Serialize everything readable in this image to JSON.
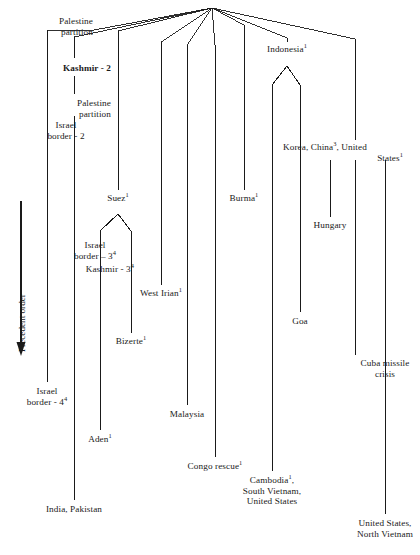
{
  "figure": {
    "kind": "tree-diagram",
    "axis": {
      "label": "Precedent order",
      "direction": "downward-arrow"
    },
    "ink": "#1a1a1a",
    "background": "#ffffff"
  },
  "nodes": [
    {
      "id": "palestine-partition-1",
      "text": "Palestine",
      "text2": "partition",
      "sup": "",
      "align": "r",
      "x": 93,
      "y": 22
    },
    {
      "id": "kashmir-2",
      "text": "Kashmir - 2",
      "sup": "",
      "align": "r",
      "x": 111,
      "y": 68
    },
    {
      "id": "palestine-partition-2",
      "text": "Palestine",
      "text2": "partition",
      "sup": "",
      "align": "r",
      "x": 111,
      "y": 104
    },
    {
      "id": "israel-border-2",
      "text": "Israel",
      "text2": "border - 2",
      "sup": "",
      "align": "r",
      "x": 66,
      "y": 126
    },
    {
      "id": "suez-1",
      "text": "Suez",
      "sup": "1",
      "align": "c",
      "x": 118,
      "y": 198
    },
    {
      "id": "burma-1",
      "text": "Burma",
      "sup": "1",
      "align": "c",
      "x": 244,
      "y": 198
    },
    {
      "id": "korea-china-us",
      "text": "Korea, China",
      "sup": "3",
      "text_tail": ", United",
      "text2": "States",
      "sup2": "1",
      "align": "c",
      "x": 355,
      "y": 148
    },
    {
      "id": "indonesia-1",
      "text": "Indonesia",
      "sup": "1",
      "align": "c",
      "x": 287,
      "y": 50
    },
    {
      "id": "israel-border-3",
      "text": "Israel",
      "text2": "border – 3",
      "sup2": "4",
      "align": "r",
      "x": 72,
      "y": 246
    },
    {
      "id": "kashmir-3",
      "text": "Kashmir - 3",
      "sup": "4",
      "align": "r",
      "x": 99,
      "y": 270
    },
    {
      "id": "hungary",
      "text": "Hungary",
      "sup": "",
      "align": "c",
      "x": 330,
      "y": 225
    },
    {
      "id": "west-irian-1",
      "text": "West Irian",
      "sup": "1",
      "align": "c",
      "x": 161,
      "y": 293
    },
    {
      "id": "bizerte-1",
      "text": "Bizerte",
      "sup": "1",
      "align": "c",
      "x": 131,
      "y": 341
    },
    {
      "id": "goa",
      "text": "Goa",
      "sup": "",
      "align": "c",
      "x": 300,
      "y": 320
    },
    {
      "id": "cuba-missile-crisis",
      "text": "Cuba missile",
      "text2": "crisis",
      "sup": "",
      "align": "c",
      "x": 385,
      "y": 363
    },
    {
      "id": "israel-border-4",
      "text": "Israel",
      "text2": "border - 4",
      "sup2": "4",
      "align": "c",
      "x": 47,
      "y": 390
    },
    {
      "id": "malaysia",
      "text": "Malaysia",
      "sup": "",
      "align": "c",
      "x": 187,
      "y": 413
    },
    {
      "id": "aden-1",
      "text": "Aden",
      "sup": "1",
      "align": "c",
      "x": 100,
      "y": 438
    },
    {
      "id": "congo-rescue-1",
      "text": "Congo rescue",
      "sup": "1",
      "align": "c",
      "x": 215,
      "y": 465
    },
    {
      "id": "india-pakistan",
      "text": "India, Pakistan",
      "sup": "",
      "align": "c",
      "x": 74,
      "y": 508
    },
    {
      "id": "cambodia-south-vietnam-us",
      "text": "Cambodia",
      "sup": "1",
      "text_tail": ",",
      "text2": "South Vietnam,",
      "text3": "United States",
      "align": "c",
      "x": 272,
      "y": 479
    },
    {
      "id": "united-states-north-vietnam",
      "text": "United States,",
      "text2": "North Vietnam",
      "sup": "",
      "align": "c",
      "x": 385,
      "y": 522
    }
  ],
  "stems": [
    {
      "id": "stem-palestine-partition-1",
      "x": 47,
      "y1": 31,
      "y2": 382
    },
    {
      "id": "stem-kashmir-2",
      "x": 74,
      "y1": 38,
      "y2": 500
    },
    {
      "id": "stem-suez-branch-left",
      "x": 100,
      "y1": 231,
      "y2": 430
    },
    {
      "id": "stem-suez-branch-right",
      "x": 131,
      "y1": 231,
      "y2": 333
    },
    {
      "id": "stem-west-irian",
      "x": 161,
      "y1": 43,
      "y2": 285
    },
    {
      "id": "stem-malaysia",
      "x": 187,
      "y1": 46,
      "y2": 405
    },
    {
      "id": "stem-congo",
      "x": 215,
      "y1": 46,
      "y2": 457
    },
    {
      "id": "stem-burma",
      "x": 244,
      "y1": 172,
      "y2": 190
    },
    {
      "id": "stem-indonesia-left",
      "x": 272,
      "y1": 85,
      "y2": 471
    },
    {
      "id": "stem-indonesia-right",
      "x": 300,
      "y1": 85,
      "y2": 312
    },
    {
      "id": "stem-hungary",
      "x": 330,
      "y1": 162,
      "y2": 217
    },
    {
      "id": "stem-cuba",
      "x": 355,
      "y1": 162,
      "y2": 355
    },
    {
      "id": "stem-us-north-vietnam",
      "x": 385,
      "y1": 162,
      "y2": 514
    }
  ],
  "arrow": {
    "x": 21,
    "y1": 201,
    "y2": 352,
    "label_x": 17,
    "label_y": 352
  }
}
